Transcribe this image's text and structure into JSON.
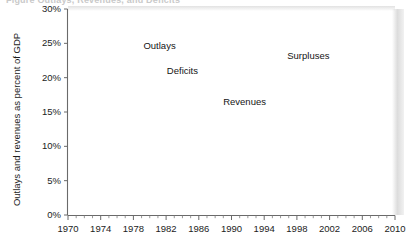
{
  "figure": {
    "partial_title": "Figure   Outlays, Revenues, and Deficits",
    "ylabel": "Outlays and revenues as percent of GDP"
  },
  "chart_data": {
    "type": "area",
    "title": "",
    "xlabel": "",
    "ylabel": "Outlays and revenues as percent of GDP",
    "xlim": [
      1970,
      2010
    ],
    "ylim": [
      0,
      30
    ],
    "grid": false,
    "legend_position": "inline-annotations",
    "y_tick_labels": [
      "0%",
      "5%",
      "10%",
      "15%",
      "20%",
      "25%",
      "30%"
    ],
    "y_tick_values": [
      0,
      5,
      10,
      15,
      20,
      25,
      30
    ],
    "x_tick_labels": [
      "1970",
      "1974",
      "1978",
      "1982",
      "1986",
      "1990",
      "1994",
      "1998",
      "2002",
      "2006",
      "2010"
    ],
    "x_tick_values": [
      1970,
      1974,
      1978,
      1982,
      1986,
      1990,
      1994,
      1998,
      2002,
      2006,
      2010
    ],
    "x_minor_step": 1,
    "fill_color": "#9a9a9a",
    "line_color": "#1a1a1a",
    "annotations": [
      {
        "text": "Outlays",
        "x": 1981.2,
        "y": 24.6
      },
      {
        "text": "Deficits",
        "x": 1984.0,
        "y": 20.9
      },
      {
        "text": "Revenues",
        "x": 1991.6,
        "y": 16.4
      },
      {
        "text": "Surpluses",
        "x": 1999.4,
        "y": 23.2
      }
    ],
    "x": [
      1970,
      1971,
      1972,
      1973,
      1974,
      1975,
      1976,
      1977,
      1978,
      1979,
      1980,
      1981,
      1982,
      1983,
      1984,
      1985,
      1986,
      1987,
      1988,
      1989,
      1990,
      1991,
      1992,
      1993,
      1994,
      1995,
      1996,
      1997,
      1998,
      1999,
      2000,
      2001,
      2002,
      2003,
      2004,
      2005,
      2006,
      2007,
      2008,
      2009,
      2010
    ],
    "series": [
      {
        "name": "Outlays",
        "values": [
          19.3,
          19.4,
          19.6,
          18.7,
          18.7,
          21.3,
          21.4,
          20.7,
          20.7,
          20.1,
          21.7,
          22.2,
          23.1,
          23.5,
          22.2,
          22.8,
          22.5,
          21.6,
          21.2,
          21.2,
          21.8,
          22.3,
          22.1,
          21.4,
          21.0,
          20.6,
          20.2,
          19.5,
          19.1,
          18.5,
          18.2,
          18.2,
          19.1,
          19.7,
          19.6,
          19.9,
          20.1,
          19.6,
          20.7,
          29.6,
          25.6
        ]
      },
      {
        "name": "Revenues",
        "values": [
          19.0,
          17.3,
          17.6,
          17.6,
          18.3,
          17.9,
          17.2,
          18.0,
          18.0,
          18.5,
          19.0,
          19.6,
          19.2,
          17.5,
          17.3,
          17.7,
          17.5,
          18.4,
          18.2,
          18.4,
          18.0,
          17.8,
          17.5,
          17.5,
          18.0,
          18.4,
          18.8,
          19.2,
          19.9,
          19.8,
          20.6,
          19.5,
          17.6,
          16.2,
          16.1,
          17.3,
          18.2,
          18.5,
          17.5,
          16.3,
          17.4
        ]
      }
    ]
  }
}
